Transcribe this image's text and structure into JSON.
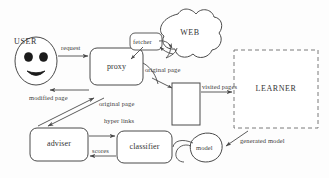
{
  "diagram": {
    "type": "flow-diagram",
    "stroke_color": "#4a4a4a",
    "text_color": "#333333",
    "background": "#fdfdfd",
    "nodes": [
      {
        "id": "user",
        "label": "USER",
        "shape": "face-oval",
        "x": 14,
        "y": 37,
        "w": 44,
        "h": 48
      },
      {
        "id": "proxy",
        "label": "proxy",
        "shape": "rounded-rect",
        "x": 90,
        "y": 48,
        "w": 53,
        "h": 37
      },
      {
        "id": "fetcher",
        "label": "fetcher",
        "shape": "rounded-rect",
        "x": 130,
        "y": 33,
        "w": 32,
        "h": 17
      },
      {
        "id": "web",
        "label": "WEB",
        "shape": "cloud",
        "x": 157,
        "y": 8,
        "w": 64,
        "h": 52
      },
      {
        "id": "visited",
        "label": "",
        "shape": "rect",
        "x": 172,
        "y": 83,
        "w": 28,
        "h": 42
      },
      {
        "id": "learner",
        "label": "LEARNER",
        "shape": "dashed-rect",
        "x": 234,
        "y": 50,
        "w": 84,
        "h": 78
      },
      {
        "id": "adviser",
        "label": "adviser",
        "shape": "rounded-rect",
        "x": 30,
        "y": 128,
        "w": 58,
        "h": 33
      },
      {
        "id": "classifier",
        "label": "classifier",
        "shape": "rounded-rect",
        "x": 117,
        "y": 131,
        "w": 55,
        "h": 32
      },
      {
        "id": "model",
        "label": "model",
        "shape": "blob",
        "x": 190,
        "y": 133,
        "w": 33,
        "h": 30
      }
    ],
    "edges": [
      {
        "id": "request",
        "label": "request",
        "from": "user",
        "to": "proxy",
        "label_x": 61,
        "label_y": 44
      },
      {
        "id": "modified-page",
        "label": "modified page",
        "from": "proxy",
        "to": "user",
        "label_x": 29,
        "label_y": 94
      },
      {
        "id": "fetch-request",
        "label": "",
        "from": "fetcher",
        "to": "web",
        "label_x": 0,
        "label_y": 0
      },
      {
        "id": "original-page-1",
        "label": "original page",
        "from": "fetcher",
        "to": "proxy",
        "label_x": 145,
        "label_y": 66
      },
      {
        "id": "original-page-2",
        "label": "original page",
        "from": "proxy",
        "to": "adviser",
        "label_x": 99,
        "label_y": 100
      },
      {
        "id": "hyper-links",
        "label": "hyper links",
        "from": "adviser",
        "to": "classifier",
        "label_x": 104,
        "label_y": 117
      },
      {
        "id": "scores",
        "label": "scores",
        "from": "classifier",
        "to": "adviser",
        "label_x": 92,
        "label_y": 147
      },
      {
        "id": "visited-pages",
        "label": "visited pages",
        "from": "visited",
        "to": "learner",
        "label_x": 202,
        "label_y": 83
      },
      {
        "id": "generated-model",
        "label": "generated model",
        "from": "learner",
        "to": "model",
        "label_x": 240,
        "label_y": 137
      },
      {
        "id": "model-feedback",
        "label": "",
        "from": "model",
        "to": "classifier",
        "label_x": 0,
        "label_y": 0
      },
      {
        "id": "proxy-to-visited",
        "label": "",
        "from": "proxy",
        "to": "visited",
        "label_x": 0,
        "label_y": 0
      }
    ]
  }
}
